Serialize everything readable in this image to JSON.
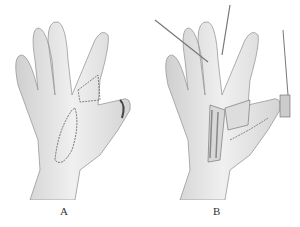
{
  "figure": {
    "panels": [
      {
        "label": "A",
        "description": "Dorsal hand with incision outline over dorsum and index finger"
      },
      {
        "label": "B",
        "description": "Dorsal hand with flap raised, retractors and exposed tendons"
      }
    ],
    "colors": {
      "skin": "#e6e6e6",
      "outline": "#8a8a8a",
      "incision": "#555555"
    }
  }
}
